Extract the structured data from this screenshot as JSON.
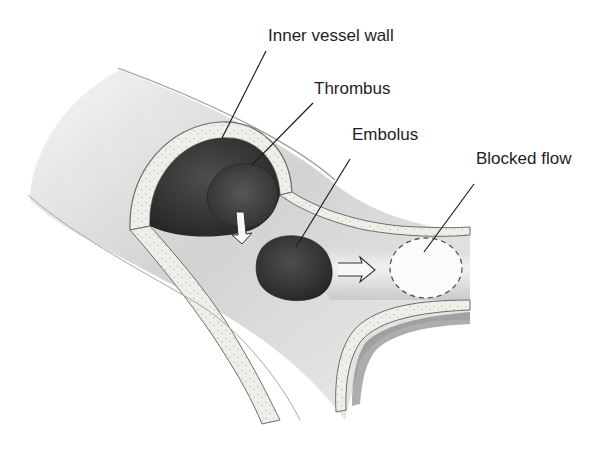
{
  "diagram": {
    "type": "medical-illustration",
    "colors": {
      "background": "#ffffff",
      "vessel_lumen": "#e4e4e4",
      "vessel_wall": "#ecece6",
      "clot": "#3a3a3a",
      "label_text": "#1e1e1e",
      "leader_line": "#1e1e1e"
    },
    "labels": [
      {
        "id": "inner-vessel-wall",
        "text": "Inner vessel wall"
      },
      {
        "id": "thrombus",
        "text": "Thrombus"
      },
      {
        "id": "embolus",
        "text": "Embolus"
      },
      {
        "id": "blocked-flow",
        "text": "Blocked flow"
      }
    ],
    "arrows": [
      {
        "id": "detach-arrow",
        "meaning": "thrombus breaks off downward"
      },
      {
        "id": "flow-arrow",
        "meaning": "embolus travels toward branch"
      }
    ]
  }
}
